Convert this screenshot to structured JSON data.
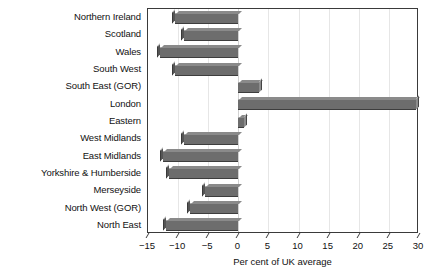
{
  "chart_data": {
    "type": "bar",
    "orientation": "horizontal",
    "title": "",
    "xlabel": "Per cent of UK average",
    "ylabel": "",
    "xlim": [
      -15,
      30
    ],
    "xticks": [
      -15,
      -10,
      -5,
      0,
      5,
      10,
      15,
      20,
      25,
      30
    ],
    "xtick_labels": [
      "−15",
      "−10",
      "−5",
      "0",
      "5",
      "10",
      "15",
      "20",
      "25",
      "30"
    ],
    "grid": true,
    "grid_axis": "x",
    "legend": null,
    "categories": [
      "Northern Ireland",
      "Scotland",
      "Wales",
      "South West",
      "South East (GOR)",
      "London",
      "Eastern",
      "West Midlands",
      "East Midlands",
      "Yorkshire & Humberside",
      "Merseyside",
      "North West (GOR)",
      "North East"
    ],
    "values": [
      -10.5,
      -9.0,
      -13.0,
      -10.5,
      3.5,
      29.5,
      1.0,
      -9.0,
      -12.5,
      -11.5,
      -5.5,
      -8.0,
      -12.0
    ],
    "bar_color": "#6d6d6d",
    "bar_edge_light": "#a9a9a9",
    "bar_edge_dark": "#3d3d3d",
    "frame_color": "#3a3a3a",
    "gridline_color": "#e6e6e6"
  }
}
